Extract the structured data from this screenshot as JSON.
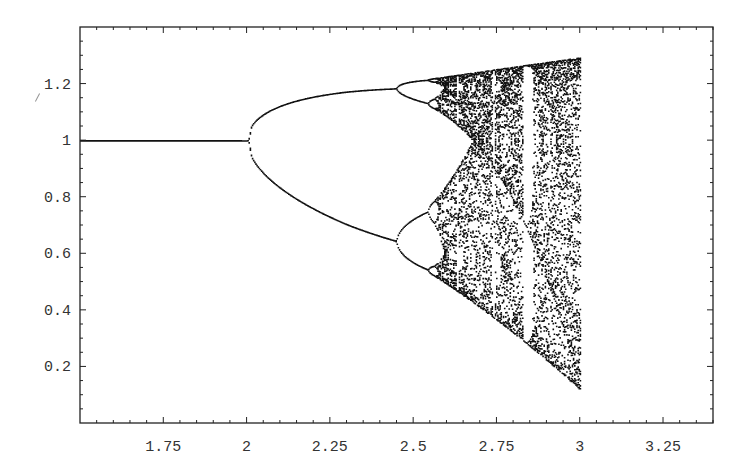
{
  "chart_data": {
    "type": "scatter",
    "title": "",
    "subtitle": "",
    "xlabel": "",
    "ylabel": "",
    "xlim": [
      1.5,
      3.4
    ],
    "ylim": [
      0,
      1.4
    ],
    "grid": false,
    "legend": null,
    "x_ticks": [
      1.75,
      2,
      2.25,
      2.5,
      2.75,
      3,
      3.25
    ],
    "x_tick_labels": [
      "1.75",
      "2",
      "2.25",
      "2.5",
      "2.75",
      "3",
      "3.25"
    ],
    "y_ticks": [
      0.2,
      0.4,
      0.6,
      0.8,
      1,
      1.2
    ],
    "y_tick_labels": [
      "0.2",
      "0.4",
      "0.6",
      "0.8",
      "1",
      "1.2"
    ],
    "x_minor_step": 0.05,
    "y_minor_step": 0.05,
    "key_points": [
      {
        "r": 1.5,
        "values": [
          1.0
        ]
      },
      {
        "r": 2.0,
        "values": [
          1.0
        ],
        "note": "first period doubling"
      },
      {
        "r": 2.25,
        "values": [
          1.11,
          0.79
        ]
      },
      {
        "r": 2.5,
        "values": [
          1.13,
          0.73
        ],
        "note": "second period doubling"
      },
      {
        "r": 2.6,
        "values": [
          1.16,
          1.1,
          0.83,
          0.66
        ],
        "note": "period 4 / onset of chaos"
      },
      {
        "r": 2.75,
        "range": [
          0.58,
          1.18
        ]
      },
      {
        "r": 2.95,
        "note": "periodic window",
        "range": [
          0.42,
          1.19
        ]
      },
      {
        "r": 3.25,
        "range": [
          0.15,
          1.22
        ]
      },
      {
        "r": 3.4,
        "range": [
          0.0,
          1.23
        ]
      }
    ],
    "upper_envelope": [
      [
        2.57,
        1.15
      ],
      [
        2.75,
        1.175
      ],
      [
        3.0,
        1.195
      ],
      [
        3.25,
        1.215
      ],
      [
        3.4,
        1.228
      ]
    ],
    "lower_envelope": [
      [
        2.57,
        0.65
      ],
      [
        2.75,
        0.55
      ],
      [
        3.0,
        0.4
      ],
      [
        3.25,
        0.16
      ],
      [
        3.4,
        0.0
      ]
    ],
    "point_color": "#111111",
    "frame_color": "#222222"
  },
  "map": {
    "samples_r": 560,
    "transient": 300,
    "plotted_iterations": 60
  }
}
